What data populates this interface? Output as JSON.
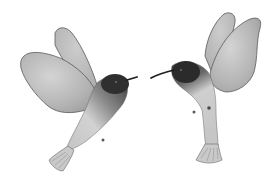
{
  "image": {
    "subject": "Two watercolor hummingbirds facing each other",
    "style": "grayscale watercolor illustration",
    "background": "#ffffff",
    "birds": [
      {
        "name": "left-hummingbird",
        "facing": "right",
        "wings": "spread up and back"
      },
      {
        "name": "right-hummingbird",
        "facing": "left",
        "wings": "raised up"
      }
    ],
    "colors": {
      "head_dark": "#2a2a2a",
      "wing_gray": "#b8b8b8",
      "body_light": "#d6d6d6",
      "outline": "#555555"
    }
  }
}
